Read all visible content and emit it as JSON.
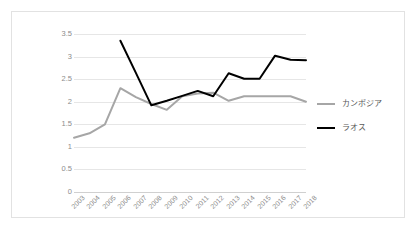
{
  "chart_data": {
    "type": "line",
    "title": "",
    "subtitle": "",
    "xlabel": "",
    "ylabel": "",
    "categories": [
      "2003",
      "2004",
      "2005",
      "2006",
      "2007",
      "2008",
      "2009",
      "2010",
      "2011",
      "2012",
      "2013",
      "2014",
      "2015",
      "2016",
      "2017",
      "2018"
    ],
    "series": [
      {
        "name": "カンボジア",
        "color": "#a6a6a6",
        "line_width": 2,
        "values": [
          1.2,
          1.3,
          1.5,
          2.3,
          2.1,
          1.95,
          1.82,
          2.12,
          2.18,
          2.2,
          2.02,
          2.12,
          2.12,
          2.12,
          2.12,
          2.0
        ]
      },
      {
        "name": "ラオス",
        "color": "#000000",
        "line_width": 2,
        "values": [
          null,
          null,
          null,
          3.35,
          2.64,
          1.92,
          2.02,
          2.13,
          2.24,
          2.12,
          2.63,
          2.51,
          2.51,
          3.02,
          2.93,
          2.92
        ]
      }
    ],
    "ylim": [
      0,
      3.5
    ],
    "yticks": [
      "0",
      "0.5",
      "1",
      "1.5",
      "2",
      "2.5",
      "3",
      "3.5"
    ],
    "ytick_values": [
      0,
      0.5,
      1,
      1.5,
      2,
      2.5,
      3,
      3.5
    ],
    "grid": true,
    "grid_color": "#e6e6e6",
    "legend_position": "right",
    "xtick_rotation": -45,
    "plot_background": "#ffffff",
    "border_color": "#e2e2e2"
  }
}
